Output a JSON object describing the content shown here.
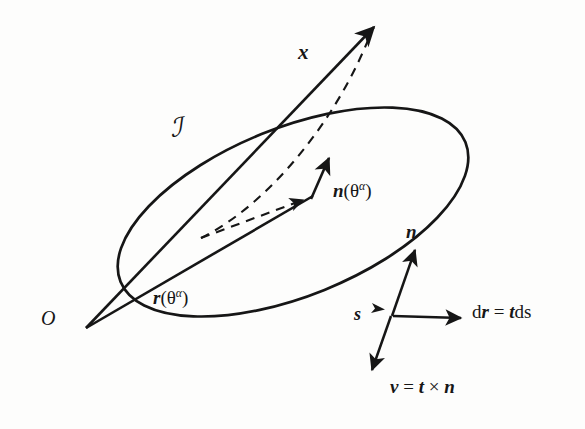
{
  "figure": {
    "domain": "diagram",
    "background_color": "#fdfdfc",
    "ink_color": "#161616",
    "width": 585,
    "height": 429
  },
  "labels": {
    "position_vector_x": "x",
    "surface_symbol": "ℐ",
    "surface_normal_field": "n",
    "surface_normal_arg_open": "(θ",
    "surface_normal_arg_sup": "α",
    "surface_normal_arg_close": ")",
    "position_field_r": "r",
    "position_field_arg_open": "(θ",
    "position_field_arg_sup": "α",
    "position_field_arg_close": ")",
    "origin": "O",
    "arclength": "s",
    "curve_normal": "n",
    "dr_lhs": "d",
    "dr_lhs_vec": "r",
    "dr_eq": " = ",
    "dr_rhs_vec": "t",
    "dr_rhs_tail": "ds",
    "binormal_lhs": "ν",
    "binormal_eq": " = ",
    "binormal_t": "t",
    "binormal_cross": " × ",
    "binormal_n": "n"
  },
  "geometry": {
    "ellipse": {
      "center_x": 293,
      "center_y": 212,
      "radius_x": 186,
      "radius_y": 84,
      "rotation_deg": -22,
      "stroke_width": 2.6,
      "style": "solid",
      "note": "closed surface boundary curve"
    },
    "vector_x": {
      "from_x": 86,
      "from_y": 328,
      "to_x": 379,
      "to_y": 22,
      "style": "solid",
      "arrowhead": "end"
    },
    "vector_r": {
      "from_x": 86,
      "from_y": 328,
      "to_x": 311,
      "to_y": 196,
      "style": "solid",
      "arrowhead": "none"
    },
    "dashed_connector": {
      "from_x": 201,
      "from_y": 237,
      "to_x": 379,
      "to_y": 22,
      "style": "dashed",
      "arrowhead": "none"
    },
    "dashed_to_normal_base": {
      "from_x": 201,
      "from_y": 237,
      "to_x": 311,
      "to_y": 197,
      "style": "dashed",
      "arrowhead": "end"
    },
    "vector_n_theta": {
      "from_x": 311,
      "from_y": 197,
      "to_x": 331,
      "to_y": 154,
      "style": "solid",
      "arrowhead": "end"
    },
    "vector_n_curve": {
      "from_x": 392,
      "from_y": 315,
      "to_x": 417,
      "to_y": 245,
      "style": "solid",
      "arrowhead": "end"
    },
    "vector_t": {
      "from_x": 392,
      "from_y": 315,
      "to_x": 466,
      "to_y": 318,
      "style": "solid",
      "arrowhead": "end"
    },
    "vector_nu": {
      "from_x": 392,
      "from_y": 315,
      "to_x": 371,
      "to_y": 375,
      "style": "solid",
      "arrowhead": "end"
    },
    "point_s": {
      "x": 381,
      "y": 308,
      "marker": "arrowhead-on-curve"
    }
  }
}
